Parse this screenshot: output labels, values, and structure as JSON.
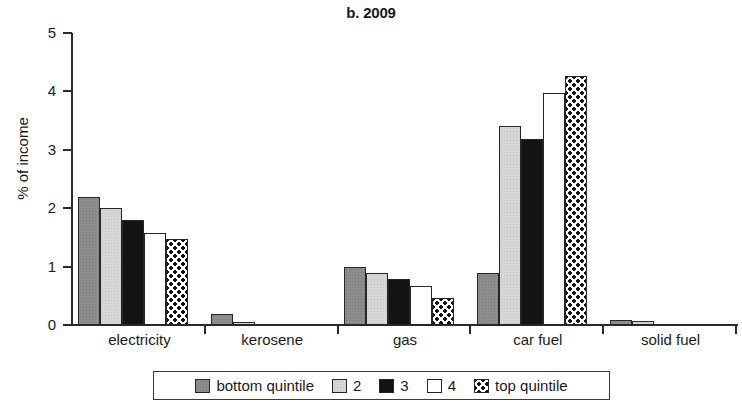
{
  "chart_data": {
    "type": "bar",
    "title": "b. 2009",
    "xlabel": "",
    "ylabel": "% of income",
    "ylim": [
      0,
      5
    ],
    "yticks": [
      0,
      1,
      2,
      3,
      4,
      5
    ],
    "ytick_labels": [
      "0",
      "1",
      "2",
      "3",
      "4",
      "5"
    ],
    "grid": false,
    "legend_position": "bottom",
    "categories": [
      "electricity",
      "kerosene",
      "gas",
      "car fuel",
      "solid fuel"
    ],
    "series": [
      {
        "name": "bottom quintile",
        "fill": "dark-gray-speckle",
        "color": "#8d8d8d",
        "values": [
          2.19,
          0.19,
          0.99,
          0.89,
          0.08
        ]
      },
      {
        "name": "2",
        "fill": "light-gray-speckle",
        "color": "#d6d6d6",
        "values": [
          2.0,
          0.05,
          0.89,
          3.4,
          0.07
        ]
      },
      {
        "name": "3",
        "fill": "solid-black",
        "color": "#141414",
        "values": [
          1.8,
          0.0,
          0.79,
          3.19,
          0.0
        ]
      },
      {
        "name": "4",
        "fill": "white",
        "color": "#ffffff",
        "values": [
          1.57,
          0.0,
          0.66,
          3.97,
          0.0
        ]
      },
      {
        "name": "top quintile",
        "fill": "checkerboard",
        "color": "#ffffff",
        "values": [
          1.47,
          0.0,
          0.46,
          4.26,
          0.0
        ]
      }
    ]
  },
  "axis": {
    "y_title": "% of income"
  }
}
